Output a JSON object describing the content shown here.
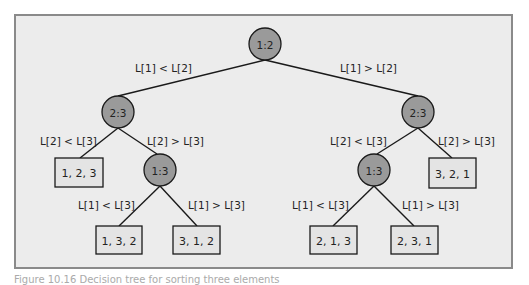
{
  "diagram": {
    "type": "decision-tree",
    "nodes": [
      {
        "id": "root",
        "label": "1:2",
        "cx": 265,
        "cy": 44
      },
      {
        "id": "l",
        "label": "2:3",
        "cx": 118,
        "cy": 112
      },
      {
        "id": "r",
        "label": "2:3",
        "cx": 418,
        "cy": 112
      },
      {
        "id": "lr",
        "label": "1:3",
        "cx": 160,
        "cy": 170
      },
      {
        "id": "rl",
        "label": "1:3",
        "cx": 374,
        "cy": 170
      }
    ],
    "leaves": [
      {
        "id": "leaf-123",
        "label": "1, 2, 3",
        "x": 55,
        "y": 158,
        "w": 48,
        "h": 29
      },
      {
        "id": "leaf-132",
        "label": "1, 3, 2",
        "x": 96,
        "y": 226,
        "w": 46,
        "h": 28
      },
      {
        "id": "leaf-312",
        "label": "3, 1, 2",
        "x": 173,
        "y": 226,
        "w": 47,
        "h": 28
      },
      {
        "id": "leaf-321",
        "label": "3, 2, 1",
        "x": 429,
        "y": 158,
        "w": 47,
        "h": 30
      },
      {
        "id": "leaf-213",
        "label": "2, 1, 3",
        "x": 310,
        "y": 226,
        "w": 47,
        "h": 28
      },
      {
        "id": "leaf-231",
        "label": "2, 3, 1",
        "x": 391,
        "y": 226,
        "w": 47,
        "h": 28
      }
    ],
    "edges": [
      {
        "from": [
          265,
          60
        ],
        "to": [
          118,
          96
        ],
        "label": "L[1] < L[2]",
        "lx": 135,
        "ly": 72
      },
      {
        "from": [
          265,
          60
        ],
        "to": [
          418,
          96
        ],
        "label": "L[1] > L[2]",
        "lx": 340,
        "ly": 72
      },
      {
        "from": [
          118,
          128
        ],
        "to": [
          80,
          158
        ],
        "label": "L[2] < L[3]",
        "lx": 40,
        "ly": 145
      },
      {
        "from": [
          118,
          128
        ],
        "to": [
          157,
          154
        ],
        "label": "L[2] > L[3]",
        "lx": 147,
        "ly": 145
      },
      {
        "from": [
          160,
          186
        ],
        "to": [
          119,
          226
        ],
        "label": "L[1] < L[3]",
        "lx": 78,
        "ly": 209
      },
      {
        "from": [
          160,
          186
        ],
        "to": [
          197,
          226
        ],
        "label": "L[1] > L[3]",
        "lx": 188,
        "ly": 209
      },
      {
        "from": [
          418,
          128
        ],
        "to": [
          377,
          154
        ],
        "label": "L[2] < L[3]",
        "lx": 330,
        "ly": 145
      },
      {
        "from": [
          418,
          128
        ],
        "to": [
          452,
          158
        ],
        "label": "L[2] > L[3]",
        "lx": 438,
        "ly": 145
      },
      {
        "from": [
          374,
          186
        ],
        "to": [
          333,
          226
        ],
        "label": "L[1] < L[3]",
        "lx": 292,
        "ly": 209
      },
      {
        "from": [
          374,
          186
        ],
        "to": [
          414,
          226
        ],
        "label": "L[1] > L[3]",
        "lx": 402,
        "ly": 209
      }
    ],
    "colors": {
      "panel_bg": "#ececec",
      "panel_border": "#8a8a8a",
      "node_fill": "#9a9a9a",
      "leaf_fill": "#e4e4e4",
      "stroke": "#1a1a1a"
    }
  },
  "caption": "Figure 10.16  Decision tree for sorting three elements"
}
